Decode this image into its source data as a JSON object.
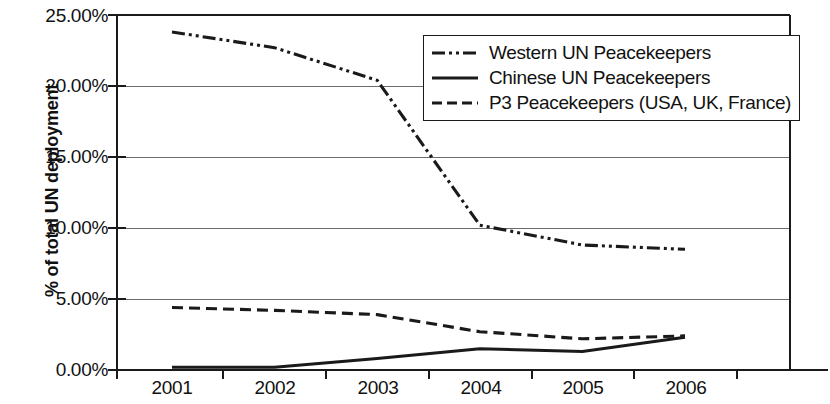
{
  "chart_data": {
    "type": "line",
    "title": "",
    "xlabel": "",
    "ylabel": "% of total UN deployment",
    "categories": [
      "2001",
      "2002",
      "2003",
      "2004",
      "2005",
      "2006"
    ],
    "x_tick_labels": [
      "2001",
      "2002",
      "2003",
      "2004",
      "2005",
      "2006"
    ],
    "y_tick_labels": [
      "0.00%",
      "5.00%",
      "10.00%",
      "15.00%",
      "20.00%",
      "25.00%"
    ],
    "y_tick_values": [
      0,
      5,
      10,
      15,
      20,
      25
    ],
    "ylim": [
      0,
      25
    ],
    "grid": "horizontal",
    "legend_position": "top-right-inside",
    "series": [
      {
        "name": "Western UN Peacekeepers",
        "style": "dash-dot-dot",
        "color": "#1a1a1a",
        "values": [
          23.8,
          22.7,
          20.4,
          10.2,
          8.8,
          8.5
        ]
      },
      {
        "name": "Chinese UN Peacekeepers",
        "style": "solid",
        "color": "#1a1a1a",
        "values": [
          0.2,
          0.2,
          0.8,
          1.5,
          1.3,
          2.3
        ]
      },
      {
        "name": "P3 Peacekeepers (USA, UK, France)",
        "style": "dashed",
        "color": "#1a1a1a",
        "values": [
          4.4,
          4.2,
          3.9,
          2.7,
          2.2,
          2.4
        ]
      }
    ]
  },
  "legend": {
    "items": [
      {
        "label": "Western UN Peacekeepers",
        "key": "dash-dot-dot-line-key"
      },
      {
        "label": "Chinese UN Peacekeepers",
        "key": "solid-line-key"
      },
      {
        "label": "P3 Peacekeepers (USA, UK, France)",
        "key": "dashed-line-key"
      }
    ]
  }
}
